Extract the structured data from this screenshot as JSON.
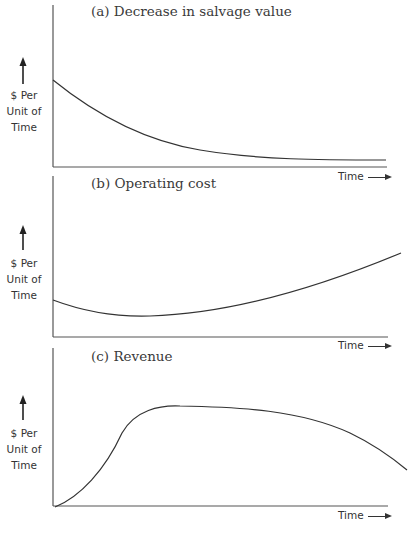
{
  "chart_data": [
    {
      "type": "line",
      "title": "(a) Decrease in salvage value",
      "xlabel": "Time",
      "ylabel": "$ Per Unit of Time",
      "grid": false,
      "axis_ticks": "none",
      "x": [
        0,
        0.1,
        0.2,
        0.3,
        0.4,
        0.5,
        0.6,
        0.7,
        0.8,
        0.9,
        1.0
      ],
      "values": [
        0.54,
        0.38,
        0.26,
        0.17,
        0.11,
        0.075,
        0.05,
        0.04,
        0.03,
        0.025,
        0.02
      ],
      "svg_path": "M53,80 C 90,110 140,140 200,150 C 260,160 320,160 386,160"
    },
    {
      "type": "line",
      "title": "(b) Operating cost",
      "xlabel": "Time",
      "ylabel": "$ Per Unit of Time",
      "grid": false,
      "axis_ticks": "none",
      "x": [
        0,
        0.1,
        0.2,
        0.3,
        0.4,
        0.5,
        0.6,
        0.7,
        0.8,
        0.9,
        1.0
      ],
      "values": [
        0.24,
        0.17,
        0.14,
        0.14,
        0.16,
        0.2,
        0.26,
        0.33,
        0.41,
        0.5,
        0.6
      ],
      "svg_path": "M53,300 C 85,312 120,317 150,316 C 220,314 300,295 401,253"
    },
    {
      "type": "line",
      "title": "(c) Revenue",
      "xlabel": "Time",
      "ylabel": "$ Per Unit of Time",
      "grid": false,
      "axis_ticks": "none",
      "x": [
        0,
        0.1,
        0.2,
        0.3,
        0.4,
        0.5,
        0.6,
        0.7,
        0.8,
        0.9,
        1.0
      ],
      "values": [
        0.0,
        0.22,
        0.58,
        0.7,
        0.72,
        0.71,
        0.69,
        0.65,
        0.58,
        0.5,
        0.4
      ],
      "svg_path": "M55,507 C 80,497 105,470 122,433 C 135,410 160,405 180,406 C 240,407 300,410 350,433 C 375,445 395,460 407,470"
    }
  ],
  "panels": [
    {
      "title": "(a) Decrease in salvage value",
      "ylabel_lines": [
        "$ Per",
        "Unit of",
        "Time"
      ],
      "xlabel": "Time"
    },
    {
      "title": "(b) Operating cost",
      "ylabel_lines": [
        "$ Per",
        "Unit of",
        "Time"
      ],
      "xlabel": "Time"
    },
    {
      "title": "(c) Revenue",
      "ylabel_lines": [
        "$ Per",
        "Unit of",
        "Time"
      ],
      "xlabel": "Time"
    }
  ],
  "colors": {
    "line": "#333333",
    "axis": "#555555",
    "background": "#ffffff"
  }
}
